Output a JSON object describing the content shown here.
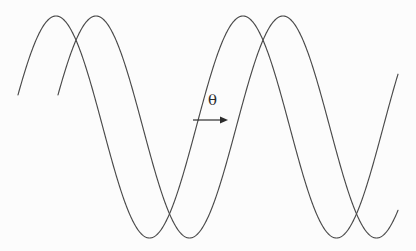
{
  "figure": {
    "background_color": "#fcfcfc",
    "stroke_color": "#4a4a4a",
    "annotation_color": "#2c2c2c",
    "width": 416,
    "height": 251
  },
  "annotation": {
    "phase_symbol": "θ",
    "symbol_x": 208,
    "symbol_y": 93,
    "arrow": {
      "x_start": 193,
      "x_end": 228,
      "y": 120,
      "head_length": 8,
      "head_half_width": 3.5
    }
  },
  "chart_data": {
    "type": "line",
    "title": "",
    "xlabel": "",
    "ylabel": "",
    "xlim": [
      0,
      416
    ],
    "ylim": [
      0,
      251
    ],
    "grid": false,
    "legend": "none",
    "axes_visible": false,
    "annotations": [
      {
        "text": "θ",
        "x": 215,
        "y": 103,
        "kind": "phase-shift-label"
      },
      {
        "kind": "arrow",
        "x_start": 193,
        "x_end": 228,
        "y": 120,
        "direction": "right",
        "meaning": "phase shift between the two waves"
      }
    ],
    "waveform": {
      "shape": "sinusoid",
      "wavelength_px": 187,
      "amplitude_px": 111,
      "center_y_px": 127,
      "peak_y_px": 16,
      "trough_y_px": 238,
      "x_draw_start": 18,
      "x_draw_end": 398
    },
    "series": [
      {
        "name": "wave-1",
        "phase_offset_px": 0,
        "peaks_x": [
          56,
          243
        ],
        "troughs_x": [
          149,
          336
        ],
        "start_point": [
          18,
          125
        ],
        "end_point": [
          365,
          125
        ]
      },
      {
        "name": "wave-2",
        "phase_offset_px": 40,
        "peaks_x": [
          96,
          283
        ],
        "troughs_x": [
          189,
          376
        ],
        "start_point": [
          58,
          125
        ],
        "end_point": [
          398,
          125
        ]
      }
    ]
  }
}
